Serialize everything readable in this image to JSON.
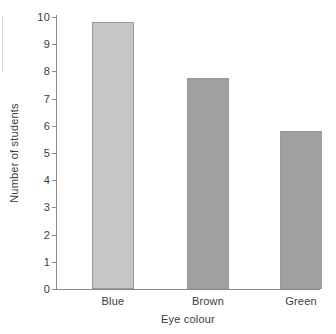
{
  "chart_data": {
    "type": "bar",
    "title": "",
    "subtitle": "",
    "xlabel": "Eye colour",
    "ylabel": "Number of students",
    "categories": [
      "Blue",
      "Brown",
      "Green"
    ],
    "values": [
      9.8,
      7.75,
      5.8
    ],
    "series": [
      {
        "name": "Number of students",
        "values": [
          9.8,
          7.75,
          5.8
        ]
      }
    ],
    "ylim": [
      0,
      10
    ],
    "y_ticks": [
      "0",
      "1",
      "2",
      "3",
      "4",
      "5",
      "6",
      "7",
      "8",
      "9",
      "10"
    ],
    "y_tick_values": [
      0,
      1,
      2,
      3,
      4,
      5,
      6,
      7,
      8,
      9,
      10
    ],
    "grid": false,
    "legend": false,
    "legend_position": "none",
    "annotations": [],
    "bar_colors": [
      "#c6c6c6",
      "#a0a0a0",
      "#a0a0a0"
    ]
  },
  "colors": {
    "background": "#ffffff",
    "axis": "#8a8a8a",
    "text": "#3b3b3b",
    "bar_light": "#c6c6c6",
    "bar_dark": "#a0a0a0"
  }
}
